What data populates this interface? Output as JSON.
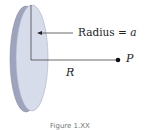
{
  "figure": {
    "radius_label": "Radius = ",
    "radius_symbol": "a",
    "distance_label": "R",
    "point_label": "P",
    "caption": "Figure 1.XX"
  },
  "colors": {
    "disk_face": "#d5dae8",
    "disk_edge": "#9aa0bb",
    "line": "#333333"
  }
}
